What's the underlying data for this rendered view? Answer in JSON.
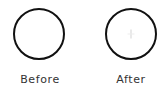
{
  "panels": [
    {
      "id": "before",
      "label": "Before",
      "shape": "circle",
      "center_mark": false,
      "stroke_color": "#111111"
    },
    {
      "id": "after",
      "label": "After",
      "shape": "circle",
      "center_mark": true,
      "center_mark_icon": "crosshair-icon",
      "stroke_color": "#111111"
    }
  ]
}
